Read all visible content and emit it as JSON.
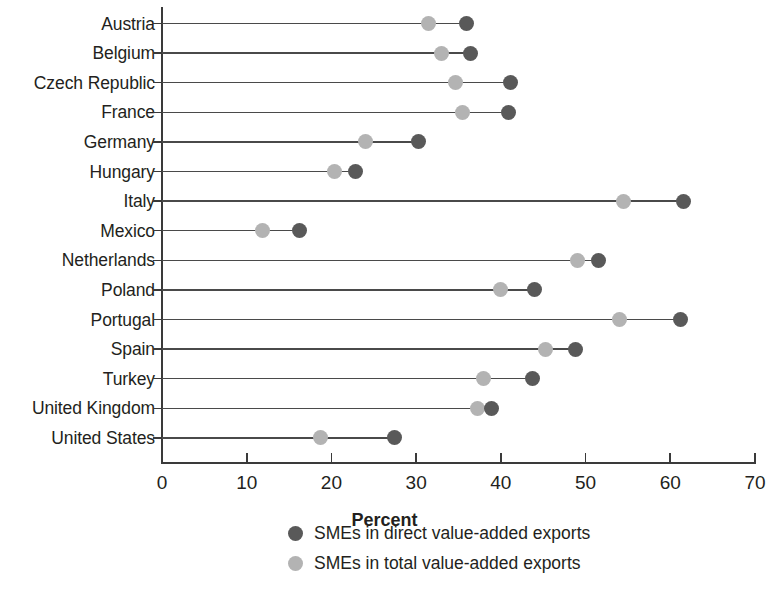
{
  "chart_data": {
    "type": "scatter",
    "subtype": "dumbbell",
    "title": "",
    "xlabel": "Percent",
    "ylabel": "",
    "xlim": [
      0,
      70
    ],
    "xticks": [
      0,
      10,
      20,
      30,
      40,
      50,
      60,
      70
    ],
    "xtick_labels": [
      "0",
      "10",
      "20",
      "30",
      "40",
      "50",
      "60",
      "70"
    ],
    "grid": false,
    "legend_position": "bottom",
    "categories": [
      "Austria",
      "Belgium",
      "Czech Republic",
      "France",
      "Germany",
      "Hungary",
      "Italy",
      "Mexico",
      "Netherlands",
      "Poland",
      "Portugal",
      "Spain",
      "Turkey",
      "United Kingdom",
      "United States"
    ],
    "series": [
      {
        "name": "SMEs in direct value-added exports",
        "color": "#595959",
        "values": [
          35.9,
          36.4,
          41.1,
          40.9,
          30.3,
          22.9,
          61.6,
          16.2,
          51.5,
          44.0,
          61.2,
          48.8,
          43.7,
          38.9,
          27.4
        ]
      },
      {
        "name": "SMEs in total value-added exports",
        "color": "#b3b3b3",
        "values": [
          31.4,
          33.0,
          34.6,
          35.5,
          24.0,
          20.4,
          54.5,
          11.9,
          49.1,
          39.9,
          54.0,
          45.3,
          37.9,
          37.3,
          18.7
        ]
      }
    ]
  },
  "legend": {
    "items": [
      {
        "label": "SMEs in direct value-added exports",
        "marker": "dark-circle-icon"
      },
      {
        "label": "SMEs in total value-added exports",
        "marker": "light-circle-icon"
      }
    ]
  },
  "axis": {
    "x_title": "Percent"
  },
  "colors": {
    "dark_marker": "#595959",
    "light_marker": "#b3b3b3",
    "axis": "#3a3a3a",
    "text": "#231f20",
    "background": "#ffffff"
  }
}
